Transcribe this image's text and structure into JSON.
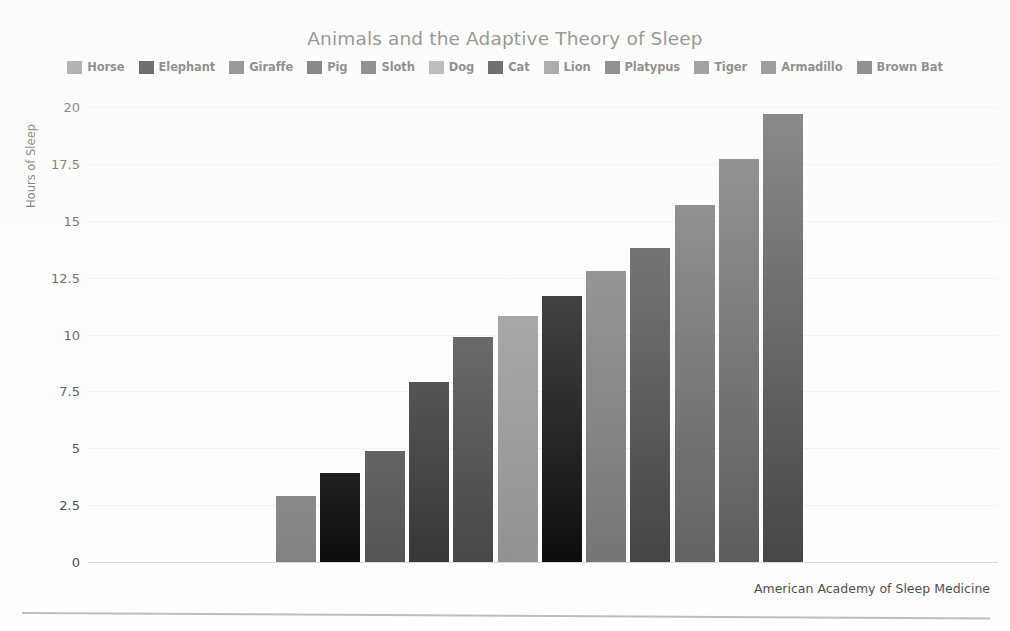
{
  "chart_data": {
    "type": "bar",
    "title": "Animals and the Adaptive Theory of Sleep",
    "xlabel": "",
    "ylabel": "Hours of Sleep",
    "ylim": [
      0,
      20
    ],
    "yticks": [
      "0",
      "2.5",
      "5",
      "7.5",
      "10",
      "12.5",
      "15",
      "17.5",
      "20"
    ],
    "ytick_values": [
      0,
      2.5,
      5,
      7.5,
      10,
      12.5,
      15,
      17.5,
      20
    ],
    "grid": true,
    "legend_position": "top",
    "categories": [
      "Horse",
      "Elephant",
      "Giraffe",
      "Pig",
      "Sloth",
      "Dog",
      "Cat",
      "Lion",
      "Platypus",
      "Tiger",
      "Armadillo",
      "Brown Bat"
    ],
    "values": [
      2.9,
      3.9,
      4.9,
      7.9,
      9.9,
      10.8,
      11.7,
      12.8,
      13.8,
      15.7,
      17.7,
      19.7
    ],
    "colors": [
      "#7b7b7b",
      "#000000",
      "#4b4b4b",
      "#2c2c2c",
      "#3d3d3d",
      "#8c8c8c",
      "#000000",
      "#6e6e6e",
      "#3a3a3a",
      "#5a5a5a",
      "#545454",
      "#3c3c3c"
    ],
    "annotations": [
      "American Academy of Sleep Medicine"
    ]
  },
  "legend": {
    "items": [
      {
        "label": "Horse",
        "color": "#7b7b7b"
      },
      {
        "label": "Elephant",
        "color": "#000000"
      },
      {
        "label": "Giraffe",
        "color": "#4b4b4b"
      },
      {
        "label": "Pig",
        "color": "#2c2c2c"
      },
      {
        "label": "Sloth",
        "color": "#3d3d3d"
      },
      {
        "label": "Dog",
        "color": "#8c8c8c"
      },
      {
        "label": "Cat",
        "color": "#000000"
      },
      {
        "label": "Lion",
        "color": "#6e6e6e"
      },
      {
        "label": "Platypus",
        "color": "#3a3a3a"
      },
      {
        "label": "Tiger",
        "color": "#5a5a5a"
      },
      {
        "label": "Armadillo",
        "color": "#545454"
      },
      {
        "label": "Brown Bat",
        "color": "#3c3c3c"
      }
    ]
  },
  "footer": {
    "source": "American Academy of Sleep Medicine"
  }
}
